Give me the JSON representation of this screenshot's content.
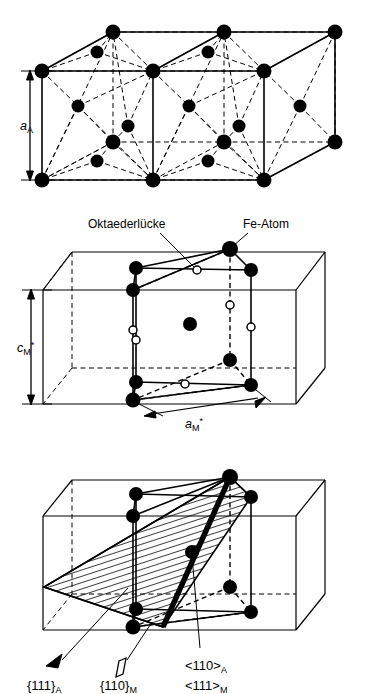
{
  "figure": {
    "colors": {
      "ink": "#000000",
      "background": "#ffffff",
      "atom_fill": "#000000",
      "interstice_fill": "#ffffff"
    }
  },
  "panels": [
    {
      "id": "fcc",
      "name": "austenite-fcc-double-cell",
      "dimension_labels": [
        {
          "symbol": "a",
          "sub": "A",
          "sup": ""
        }
      ],
      "atom_legend": "Fe-Atom"
    },
    {
      "id": "bct",
      "name": "martensite-bct-cell",
      "annotations": [
        {
          "text": "Oktaederlücke",
          "target": "octahedral-interstice"
        },
        {
          "text": "Fe-Atom",
          "target": "iron-atom"
        }
      ],
      "dimension_labels": [
        {
          "symbol": "c",
          "sub": "M",
          "sup": "*"
        },
        {
          "symbol": "a",
          "sub": "M",
          "sup": "*"
        }
      ]
    },
    {
      "id": "plane",
      "name": "habit-plane-orientation",
      "notations": [
        {
          "id": "plane-a",
          "open": "{",
          "indices": "111",
          "close": "}",
          "sub": "A",
          "marker": "filled-plane-marker"
        },
        {
          "id": "plane-m",
          "open": "{",
          "indices": "110",
          "close": "}",
          "sub": "M",
          "marker": "open-plane-marker"
        },
        {
          "id": "dir-a",
          "open": "<",
          "indices": "110",
          "close": ">",
          "sub": "A",
          "marker": "none"
        },
        {
          "id": "dir-m",
          "open": "<",
          "indices": "111",
          "close": ">",
          "sub": "M",
          "marker": "none"
        }
      ]
    }
  ],
  "labels": {
    "a_A": "a",
    "a_A_sub": "A",
    "c_M": "c",
    "c_M_sub": "M",
    "c_M_sup": "*",
    "a_M": "a",
    "a_M_sub": "M",
    "a_M_sup": "*",
    "oktaederluecke": "Oktaederlücke",
    "fe_atom": "Fe-Atom",
    "plane_111_A": "{111}",
    "plane_111_A_sub": "A",
    "plane_110_M": "{110}",
    "plane_110_M_sub": "M",
    "dir_110_A": "<110>",
    "dir_110_A_sub": "A",
    "dir_111_M": "<111>",
    "dir_111_M_sub": "M"
  }
}
